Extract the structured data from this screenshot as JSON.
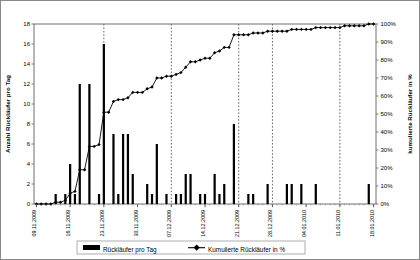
{
  "chart_data": {
    "type": "bar",
    "title": "",
    "xlabel": "",
    "ylabel": "Anzahl Rückläufer pro Tag",
    "y2label": "kumulierte Rückläufer in %",
    "ylim": [
      0,
      18
    ],
    "y2lim": [
      0,
      100
    ],
    "grid": "vertical dashed weekly gridlines",
    "legend_position": "bottom-center",
    "y_ticks": [
      "0",
      "2",
      "4",
      "6",
      "8",
      "10",
      "12",
      "14",
      "16",
      "18"
    ],
    "y_tick_values": [
      0,
      2,
      4,
      6,
      8,
      10,
      12,
      14,
      16,
      18
    ],
    "y2_ticks": [
      "0%",
      "10%",
      "20%",
      "30%",
      "40%",
      "50%",
      "60%",
      "70%",
      "80%",
      "90%",
      "100%"
    ],
    "y2_tick_values": [
      0,
      10,
      20,
      30,
      40,
      50,
      60,
      70,
      80,
      90,
      100
    ],
    "x_tick_labels": [
      "09.11.2009",
      "16.11.2009",
      "23.11.2009",
      "30.11.2009",
      "07.12.2009",
      "14.12.2009",
      "21.12.2009",
      "28.12.2009",
      "04.01.2010",
      "11.01.2010",
      "18.01.2010"
    ],
    "x_tick_indices": [
      0,
      7,
      14,
      21,
      28,
      35,
      42,
      49,
      56,
      63,
      70
    ],
    "gridline_indices": [
      14,
      28,
      42,
      49,
      63
    ],
    "series": [
      {
        "name": "Rückläufer pro Tag",
        "type": "bar",
        "axis": "left",
        "color": "#000000",
        "values": [
          0,
          0,
          0,
          0,
          1,
          0,
          1,
          4,
          1,
          12,
          0,
          12,
          0,
          1,
          16,
          0,
          7,
          1,
          7,
          7,
          3,
          0,
          0,
          2,
          1,
          6,
          0,
          1,
          0,
          1,
          1,
          3,
          3,
          0,
          1,
          1,
          0,
          3,
          1,
          2,
          0,
          8,
          0,
          0,
          1,
          1,
          0,
          0,
          2,
          0,
          0,
          0,
          2,
          2,
          0,
          2,
          0,
          0,
          2,
          0,
          0,
          0,
          0,
          0,
          0,
          0,
          0,
          0,
          0,
          2,
          0
        ]
      },
      {
        "name": "Kumulierte Rückläufer in %",
        "type": "line",
        "axis": "right",
        "color": "#000000",
        "marker": "diamond",
        "values": [
          0,
          0,
          0,
          0,
          1,
          1,
          2,
          6,
          7,
          19,
          19,
          32,
          32,
          33,
          51,
          51,
          57,
          58,
          58,
          59,
          62,
          62,
          62,
          64,
          65,
          70,
          70,
          71,
          71,
          72,
          73,
          76,
          79,
          79,
          80,
          81,
          81,
          84,
          85,
          87,
          87,
          94,
          94,
          94,
          94,
          95,
          95,
          95,
          96,
          96,
          96,
          96,
          96,
          97,
          97,
          97,
          97,
          97,
          98,
          98,
          98,
          98,
          98,
          98,
          99,
          99,
          99,
          99,
          99,
          100,
          100
        ]
      }
    ]
  },
  "legend": {
    "items": [
      {
        "label": "Rückläufer pro Tag",
        "marker": "bar-swatch"
      },
      {
        "label": "Kumulierte Rückläufer in %",
        "marker": "line-marker"
      }
    ]
  }
}
